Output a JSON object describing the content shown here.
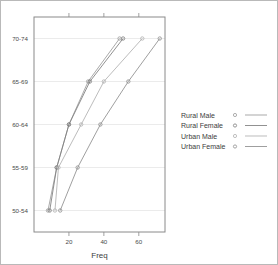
{
  "page": {
    "background": "#ffffff",
    "border_color": "#b9b9b9"
  },
  "chart_data": {
    "type": "line",
    "title": "",
    "xlabel": "Freq",
    "ylabel": "",
    "categories": [
      "50-54",
      "55-59",
      "60-64",
      "65-69",
      "70-74"
    ],
    "xlim": [
      0,
      75
    ],
    "xticks": [
      20,
      40,
      60
    ],
    "xticklabels": [
      "20",
      "40",
      "60"
    ],
    "grid": true,
    "grid_axis": "y",
    "legend_position": "right",
    "series": [
      {
        "name": "Rural Male",
        "color": "#9a9a9a",
        "marker": "circle",
        "values": [
          8,
          13,
          20,
          31,
          49
        ]
      },
      {
        "name": "Rural Female",
        "color": "#7d7d7d",
        "marker": "circle",
        "values": [
          9,
          13,
          20,
          32,
          51
        ]
      },
      {
        "name": "Urban Male",
        "color": "#b0b0b0",
        "marker": "circle",
        "values": [
          12,
          14,
          27,
          40,
          62
        ]
      },
      {
        "name": "Urban Female",
        "color": "#8e8e8e",
        "marker": "circle",
        "values": [
          15,
          25,
          38,
          54,
          72
        ]
      }
    ]
  },
  "legend": {
    "entries": [
      {
        "label": "Rural Male"
      },
      {
        "label": "Rural Female"
      },
      {
        "label": "Urban Male"
      },
      {
        "label": "Urban Female"
      }
    ]
  }
}
